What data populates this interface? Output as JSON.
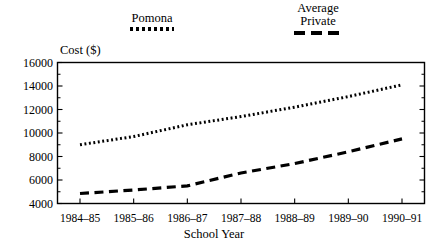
{
  "chart_data": {
    "type": "line",
    "title": "",
    "xlabel": "School Year",
    "ylabel": "Cost ($)",
    "categories": [
      "1984–85",
      "1985–86",
      "1986–87",
      "1987–88",
      "1988–89",
      "1989–90",
      "1990–91"
    ],
    "ylim": [
      4000,
      16000
    ],
    "yticks": [
      4000,
      6000,
      8000,
      10000,
      12000,
      14000,
      16000
    ],
    "ytick_labels": [
      "4000",
      "6000",
      "8000",
      "10000",
      "12000",
      "14000",
      "16000"
    ],
    "minor_ticks": true,
    "grid": false,
    "legend_position": "above-plot",
    "series": [
      {
        "name": "Pomona",
        "style": "dotted",
        "color": "#000000",
        "values": [
          9000,
          9700,
          10700,
          11400,
          12200,
          13100,
          14100
        ]
      },
      {
        "name": "Average Private",
        "style": "dashed",
        "color": "#000000",
        "values": [
          4850,
          5150,
          5500,
          6600,
          7400,
          8400,
          9500
        ]
      }
    ]
  },
  "legend": {
    "entries": [
      {
        "label": "Pomona",
        "sample": "dotted-line-sample"
      },
      {
        "label": "Average\nPrivate",
        "sample": "dashed-line-sample"
      }
    ]
  },
  "axes": {
    "y_title": "Cost ($)",
    "x_title": "School Year"
  }
}
